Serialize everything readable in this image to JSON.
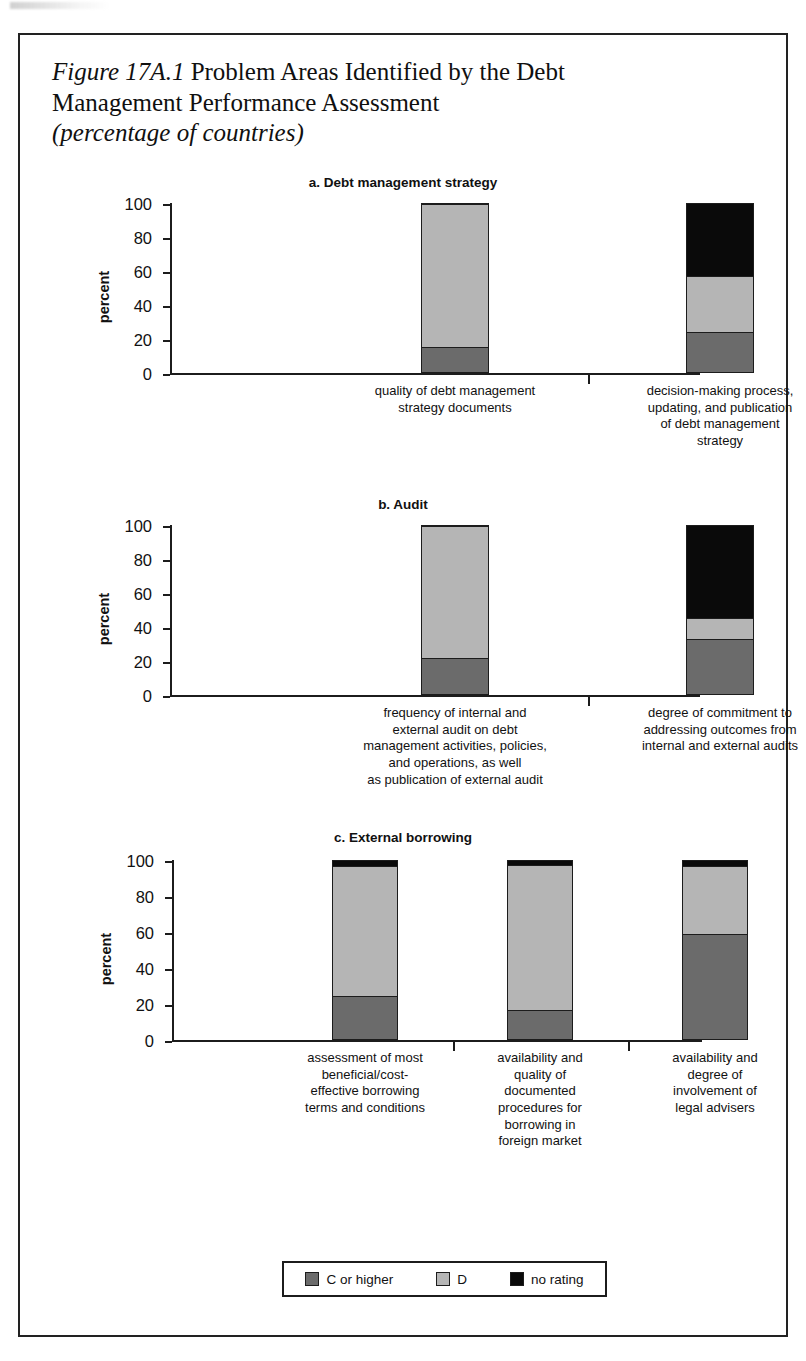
{
  "figure": {
    "number": "Figure 17A.1",
    "title_main": "Problem Areas Identified by the Debt Management Performance Assessment",
    "title_line1_rest": " Problem Areas Identified by the Debt",
    "title_line2": "Management Performance Assessment",
    "subtitle": "(percentage of countries)"
  },
  "legend": {
    "items": [
      {
        "label": "C or higher",
        "color": "#6b6b6b",
        "swatch_name": "legend-swatch-c-or-higher"
      },
      {
        "label": "D",
        "color": "#b5b5b5",
        "swatch_name": "legend-swatch-d"
      },
      {
        "label": "no rating",
        "color": "#0a0a0a",
        "swatch_name": "legend-swatch-no-rating"
      }
    ]
  },
  "colors": {
    "c_or_higher": "#6b6b6b",
    "d": "#b5b5b5",
    "no_rating": "#0a0a0a",
    "axis": "#1c1c1c",
    "text": "#111111",
    "background": "#ffffff"
  },
  "axis": {
    "ylabel": "percent",
    "yticks": [
      "0",
      "20",
      "40",
      "60",
      "80",
      "100"
    ],
    "ymin": 0,
    "ymax": 100
  },
  "chart_data": [
    {
      "type": "bar",
      "subtype": "stacked",
      "panel": "a",
      "title": "a. Debt management strategy",
      "xlabel": "",
      "ylabel": "percent",
      "ylim": [
        0,
        100
      ],
      "grid": false,
      "legend_position": "bottom-shared",
      "categories": [
        "quality of debt management\nstrategy documents",
        "decision-making process,\nupdating, and publication\nof debt management\nstrategy"
      ],
      "category_lines": [
        [
          "quality of debt management",
          "strategy documents"
        ],
        [
          "decision-making process,",
          "updating, and publication",
          "of debt management",
          "strategy"
        ]
      ],
      "series": [
        {
          "name": "C or higher",
          "values": [
            15,
            24
          ]
        },
        {
          "name": "D",
          "values": [
            85,
            33
          ]
        },
        {
          "name": "no rating",
          "values": [
            0,
            43
          ]
        }
      ]
    },
    {
      "type": "bar",
      "subtype": "stacked",
      "panel": "b",
      "title": "b. Audit",
      "xlabel": "",
      "ylabel": "percent",
      "ylim": [
        0,
        100
      ],
      "grid": false,
      "legend_position": "bottom-shared",
      "categories": [
        "frequency of internal and external audit on debt management activities, policies, and operations, as well as publication of external audit",
        "degree of commitment to addressing outcomes from internal and external audits"
      ],
      "category_lines": [
        [
          "frequency of internal and",
          "external audit on debt",
          "management activities, policies,",
          "and operations, as well",
          "as publication of external audit"
        ],
        [
          "degree of commitment to",
          "addressing outcomes from",
          "internal and external audits"
        ]
      ],
      "series": [
        {
          "name": "C or higher",
          "values": [
            21.5,
            33
          ]
        },
        {
          "name": "D",
          "values": [
            78.5,
            12
          ]
        },
        {
          "name": "no rating",
          "values": [
            0,
            55
          ]
        }
      ]
    },
    {
      "type": "bar",
      "subtype": "stacked",
      "panel": "c",
      "title": "c. External borrowing",
      "xlabel": "",
      "ylabel": "percent",
      "ylim": [
        0,
        100
      ],
      "grid": false,
      "legend_position": "bottom-shared",
      "categories": [
        "assessment of most beneficial/cost-effective borrowing terms and conditions",
        "availability and quality of documented procedures for borrowing in foreign market",
        "availability and degree of involvement of legal advisers"
      ],
      "category_lines": [
        [
          "assessment of most",
          "beneficial/cost-",
          "effective borrowing",
          "terms and conditions"
        ],
        [
          "availability and",
          "quality of",
          "documented",
          "procedures for",
          "borrowing in",
          "foreign market"
        ],
        [
          "availability and",
          "degree of",
          "involvement of",
          "legal advisers"
        ]
      ],
      "series": [
        {
          "name": "C or higher",
          "values": [
            24,
            16.5,
            59
          ]
        },
        {
          "name": "D",
          "values": [
            73,
            81.5,
            38
          ]
        },
        {
          "name": "no rating",
          "values": [
            3,
            2,
            3
          ]
        }
      ]
    }
  ]
}
